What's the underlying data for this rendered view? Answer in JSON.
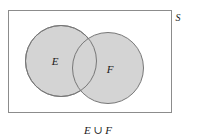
{
  "figure": {
    "universe_label": "S",
    "caption": "E ∪ F",
    "background_color": "#ffffff"
  },
  "rectangle": {
    "name": "universal-set-boundary",
    "x": 8,
    "y": 10,
    "width": 164,
    "height": 103,
    "stroke_color": "#8c8c8c",
    "fill_color": "#ffffff"
  },
  "sets": [
    {
      "label": "E",
      "cx": 61,
      "cy": 61,
      "r": 36,
      "fill_color": "#d4d4d4",
      "stroke_color": "#777777",
      "label_x": 55,
      "label_y": 62
    },
    {
      "label": "F",
      "cx": 108,
      "cy": 68,
      "r": 36,
      "fill_color": "#d4d4d4",
      "stroke_color": "#777777",
      "label_x": 110,
      "label_y": 70
    }
  ],
  "universe_label_position": {
    "x": 178,
    "y": 18
  },
  "caption_position": {
    "x": 98,
    "y": 130
  }
}
